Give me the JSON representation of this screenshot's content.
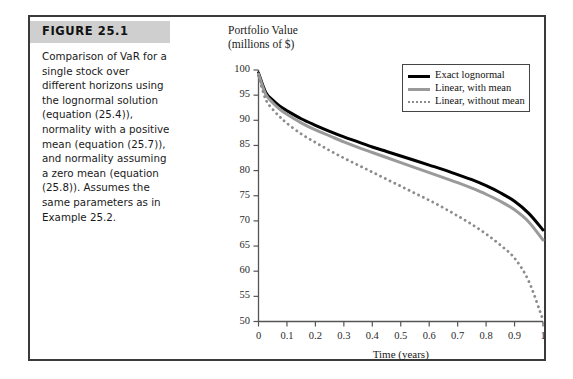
{
  "figure": {
    "label": "FIGURE 25.1",
    "caption": "Comparison of VaR for a single stock over different horizons using the lognormal solution (equation (25.4)), normality with a positive mean (equation (25.7)), and normality assuming a zero mean (equation (25.8)). Assumes the same parameters as in Example 25.2."
  },
  "chart_data": {
    "type": "line",
    "title": "",
    "ylabel": "Portfolio Value\n(millions of $)",
    "xlabel": "Time (years)",
    "xlim": [
      0,
      1
    ],
    "ylim": [
      50,
      100
    ],
    "grid": false,
    "legend_position": "top-right",
    "xticks": [
      "0",
      "0.1",
      "0.2",
      "0.3",
      "0.4",
      "0.5",
      "0.6",
      "0.7",
      "0.8",
      "0.9",
      "1"
    ],
    "xtick_values": [
      0,
      0.1,
      0.2,
      0.3,
      0.4,
      0.5,
      0.6,
      0.7,
      0.8,
      0.9,
      1
    ],
    "yticks": [
      "50",
      "55",
      "60",
      "65",
      "70",
      "75",
      "80",
      "85",
      "90",
      "95",
      "100"
    ],
    "ytick_values": [
      50,
      55,
      60,
      65,
      70,
      75,
      80,
      85,
      90,
      95,
      100
    ],
    "x": [
      0,
      0.025,
      0.05,
      0.075,
      0.1,
      0.15,
      0.2,
      0.25,
      0.3,
      0.35,
      0.4,
      0.45,
      0.5,
      0.55,
      0.6,
      0.65,
      0.7,
      0.75,
      0.8,
      0.85,
      0.9,
      0.95,
      1
    ],
    "series": [
      {
        "name": "Exact lognormal",
        "color": "#000000",
        "style": "solid",
        "width": 3,
        "values": [
          99.4,
          95.6,
          94.0,
          92.8,
          91.9,
          90.3,
          89.0,
          87.8,
          86.7,
          85.7,
          84.7,
          83.8,
          82.9,
          82.0,
          81.1,
          80.2,
          79.2,
          78.2,
          77.0,
          75.6,
          73.9,
          71.5,
          68.2
        ]
      },
      {
        "name": "Linear, with mean",
        "color": "#9a9a9a",
        "style": "solid",
        "width": 3,
        "values": [
          99.2,
          95.2,
          93.5,
          92.2,
          91.2,
          89.5,
          88.1,
          86.9,
          85.7,
          84.6,
          83.6,
          82.6,
          81.6,
          80.6,
          79.6,
          78.6,
          77.6,
          76.5,
          75.3,
          73.9,
          72.2,
          69.8,
          66.2
        ]
      },
      {
        "name": "Linear, without mean",
        "color": "#8c8c8c",
        "style": "dotted",
        "width": 2.8,
        "values": [
          98.8,
          94.2,
          92.2,
          90.7,
          89.4,
          87.3,
          85.6,
          84.0,
          82.5,
          81.1,
          79.7,
          78.3,
          76.9,
          75.5,
          74.1,
          72.6,
          71.0,
          69.3,
          67.4,
          65.2,
          62.6,
          58.0,
          50.3
        ]
      }
    ]
  }
}
